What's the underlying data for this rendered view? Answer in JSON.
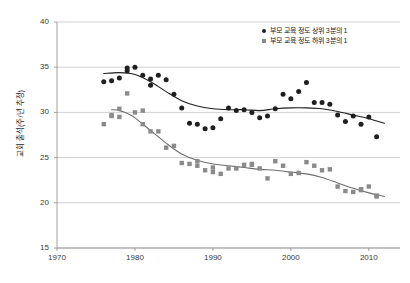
{
  "chart_data": {
    "type": "scatter",
    "title": "",
    "subtitle": "",
    "xlabel": "",
    "ylabel": "교회 출석(주/년 추정)",
    "xlim": [
      1970,
      2014
    ],
    "ylim": [
      15,
      40
    ],
    "xticks": [
      1970,
      1980,
      1990,
      2000,
      2010
    ],
    "yticks": [
      15,
      20,
      25,
      30,
      35,
      40
    ],
    "grid": "horizontal",
    "legend_position": "top-right",
    "series": [
      {
        "name": "부모 교육 정도 상위 3분의 1",
        "marker": "circle",
        "color": "#1f1f1f",
        "trendline_color": "#1f1f1f",
        "x": [
          1976,
          1977,
          1978,
          1979,
          1979,
          1980,
          1981,
          1982,
          1982,
          1983,
          1984,
          1985,
          1986,
          1987,
          1988,
          1989,
          1990,
          1991,
          1992,
          1993,
          1994,
          1995,
          1996,
          1997,
          1998,
          1999,
          2000,
          2001,
          2002,
          2003,
          2004,
          2005,
          2006,
          2007,
          2008,
          2009,
          2010,
          2011
        ],
        "y": [
          33.4,
          33.5,
          33.8,
          34.6,
          34.9,
          35.0,
          34.1,
          33.0,
          33.7,
          34.1,
          33.6,
          32.0,
          30.5,
          28.8,
          28.7,
          28.2,
          28.3,
          29.3,
          30.5,
          30.2,
          30.3,
          30.0,
          29.4,
          29.6,
          30.4,
          32.0,
          31.5,
          32.3,
          33.3,
          31.1,
          31.1,
          30.9,
          29.7,
          29.0,
          29.6,
          28.7,
          29.5,
          27.3
        ],
        "trendline_points": [
          [
            1976,
            34.3
          ],
          [
            1978,
            34.4
          ],
          [
            1980,
            34.2
          ],
          [
            1982,
            33.4
          ],
          [
            1984,
            32.3
          ],
          [
            1986,
            31.3
          ],
          [
            1988,
            30.7
          ],
          [
            1990,
            30.4
          ],
          [
            1992,
            30.3
          ],
          [
            1994,
            30.3
          ],
          [
            1996,
            30.2
          ],
          [
            1998,
            30.4
          ],
          [
            2000,
            30.5
          ],
          [
            2002,
            30.5
          ],
          [
            2004,
            30.4
          ],
          [
            2006,
            30.1
          ],
          [
            2008,
            29.7
          ],
          [
            2010,
            29.3
          ],
          [
            2012,
            28.8
          ]
        ]
      },
      {
        "name": "부모 교육 정도 하위 3분의 1",
        "marker": "square",
        "color": "#8a8a8a",
        "trendline_color": "#6f6f6f",
        "x": [
          1976,
          1977,
          1977,
          1978,
          1978,
          1979,
          1980,
          1981,
          1981,
          1982,
          1983,
          1984,
          1985,
          1986,
          1987,
          1988,
          1988,
          1989,
          1990,
          1990,
          1991,
          1992,
          1993,
          1994,
          1995,
          1995,
          1996,
          1997,
          1998,
          1999,
          2000,
          2001,
          2002,
          2003,
          2004,
          2005,
          2006,
          2007,
          2008,
          2009,
          2009,
          2010,
          2011,
          2011
        ],
        "y": [
          28.7,
          29.7,
          29.6,
          29.5,
          30.4,
          32.1,
          30.0,
          30.2,
          28.7,
          27.9,
          27.9,
          26.1,
          26.3,
          24.4,
          24.3,
          24.1,
          24.6,
          23.6,
          23.4,
          23.9,
          23.2,
          23.8,
          23.8,
          24.2,
          24.2,
          24.3,
          23.8,
          22.7,
          24.6,
          24.1,
          23.2,
          23.3,
          24.5,
          24.1,
          23.6,
          23.7,
          21.8,
          21.3,
          21.2,
          21.5,
          21.4,
          21.8,
          20.8,
          20.7
        ],
        "trendline_points": [
          [
            1977,
            30.3
          ],
          [
            1978,
            30.2
          ],
          [
            1979,
            29.9
          ],
          [
            1980,
            29.4
          ],
          [
            1982,
            28.0
          ],
          [
            1984,
            26.6
          ],
          [
            1986,
            25.4
          ],
          [
            1988,
            24.7
          ],
          [
            1990,
            24.3
          ],
          [
            1992,
            24.1
          ],
          [
            1994,
            23.9
          ],
          [
            1996,
            23.7
          ],
          [
            1998,
            23.6
          ],
          [
            2000,
            23.4
          ],
          [
            2002,
            23.2
          ],
          [
            2004,
            22.8
          ],
          [
            2006,
            22.2
          ],
          [
            2008,
            21.6
          ],
          [
            2010,
            21.1
          ],
          [
            2012,
            20.7
          ]
        ]
      }
    ]
  }
}
